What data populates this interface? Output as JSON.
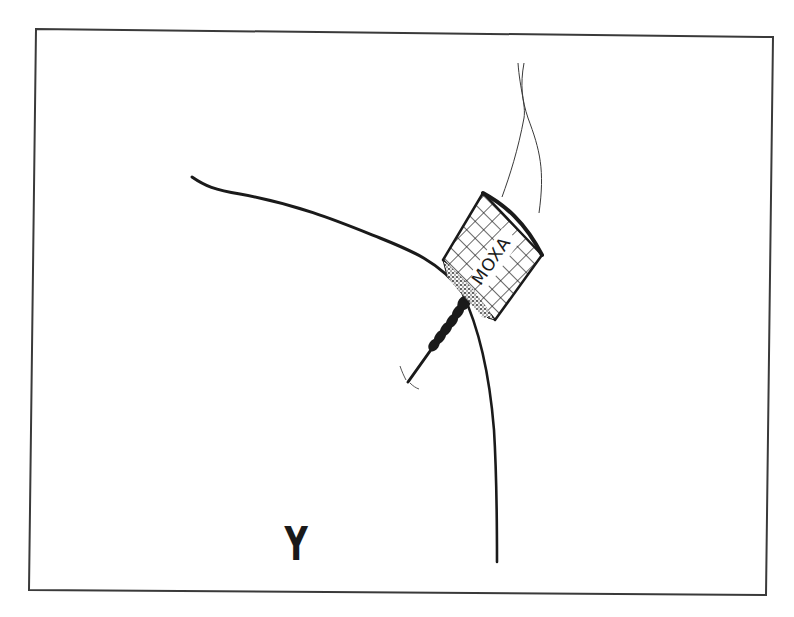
{
  "figure": {
    "colors": {
      "ink": "#1a1a1a",
      "frame": "#3a3a3a",
      "background": "#ffffff"
    }
  },
  "moxa": {
    "label": "MOXA"
  },
  "annotations": {
    "mark": "Y"
  },
  "elements": {
    "frame": "border-frame",
    "shoulder": "shoulder-contour",
    "arm": "arm-contour",
    "needle": "acupuncture-needle",
    "cylinder": "moxa-cylinder",
    "smoke": "smoke-wisps"
  }
}
